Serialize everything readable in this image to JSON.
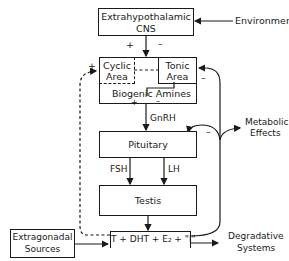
{
  "diagram": {
    "nodes": {
      "cns": {
        "line1": "Extrahypothalamic",
        "line2": "CNS"
      },
      "environment": "Environment",
      "cyclic": {
        "line1": "Cyclic",
        "line2": "Area"
      },
      "tonic": {
        "line1": "Tonic",
        "line2": "Area"
      },
      "amines": "Biogenic Amines",
      "pituitary": "Pituitary",
      "testis": "Testis",
      "hormones": "T + DHT + E₂ + \"I\"",
      "extragonadal": {
        "line1": "Extragonadal",
        "line2": "Sources"
      },
      "metabolic": {
        "line1": "Metabolic",
        "line2": "Effects"
      },
      "degradative": {
        "line1": "Degradative",
        "line2": "Systems"
      }
    },
    "edge_labels": {
      "gnrh": "GnRH",
      "fsh": "FSH",
      "lh": "LH",
      "plus": "+",
      "minus": "–"
    }
  }
}
